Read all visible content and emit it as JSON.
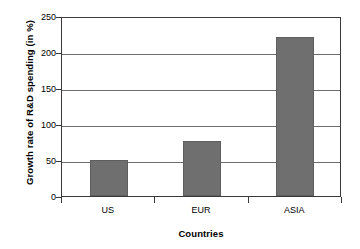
{
  "chart_data": {
    "type": "bar",
    "title": "",
    "xlabel": "Countries",
    "ylabel": "Growth rate of R&D spending (in %)",
    "categories": [
      "US",
      "EUR",
      "ASIA"
    ],
    "values": [
      50,
      76,
      221
    ],
    "series": [
      {
        "name": "Growth rate of R&D spending",
        "values": [
          50,
          76,
          221
        ]
      }
    ],
    "ylim": [
      0,
      250
    ],
    "yticks": [
      0,
      50,
      100,
      150,
      200,
      250
    ],
    "ytick_labels": [
      "0",
      "50",
      "100",
      "150",
      "200",
      "250"
    ],
    "grid": "horizontal",
    "legend": "none",
    "bar_color": "#706F6F",
    "frame_color": "#3A3A3A",
    "gridline_color": "#6E6E6E",
    "background_color": "#FFFFFF"
  }
}
